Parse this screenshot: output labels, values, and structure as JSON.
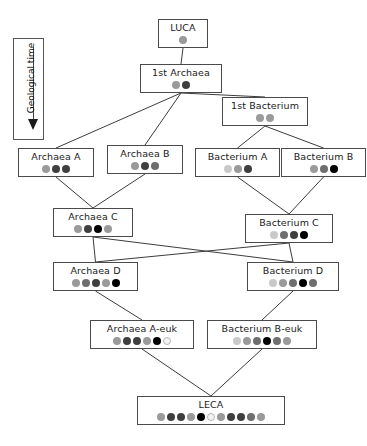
{
  "figure": {
    "type": "diagram",
    "subtype": "genome-evolution-tree",
    "axis": {
      "label": "Geological time",
      "direction_icon": "down-arrow-icon"
    }
  },
  "palette": {
    "light": "#c9c9c9",
    "gray": "#9a9a9a",
    "mid": "#6e6e6e",
    "dark": "#3f3f3f",
    "black": "#000000",
    "white": "#f4f4f4",
    "box_border": "#4a4a4a",
    "edge": "#3c3c3c",
    "background": "#ffffff"
  },
  "nodes": [
    {
      "id": "luca",
      "label": "LUCA",
      "genes": [
        "gray"
      ],
      "x": 158,
      "y": 19,
      "w": 50
    },
    {
      "id": "first_archaea",
      "label": "1st Archaea",
      "genes": [
        "gray",
        "dark"
      ],
      "x": 140,
      "y": 64,
      "w": 82
    },
    {
      "id": "first_bact",
      "label": "1st Bacterium",
      "genes": [
        "gray",
        "gray"
      ],
      "x": 222,
      "y": 97,
      "w": 86
    },
    {
      "id": "archaea_a",
      "label": "Archaea A",
      "genes": [
        "gray",
        "dark",
        "dark"
      ],
      "x": 18,
      "y": 148,
      "w": 76
    },
    {
      "id": "archaea_b",
      "label": "Archaea B",
      "genes": [
        "gray",
        "dark",
        "mid"
      ],
      "x": 107,
      "y": 145,
      "w": 76
    },
    {
      "id": "bacterium_a",
      "label": "Bacterium A",
      "genes": [
        "light",
        "gray",
        "dark"
      ],
      "x": 195,
      "y": 148,
      "w": 85
    },
    {
      "id": "bacterium_b",
      "label": "Bacterium B",
      "genes": [
        "gray",
        "mid",
        "black"
      ],
      "x": 281,
      "y": 148,
      "w": 85
    },
    {
      "id": "archaea_c",
      "label": "Archaea C",
      "genes": [
        "gray",
        "dark",
        "black",
        "gray"
      ],
      "x": 53,
      "y": 208,
      "w": 80
    },
    {
      "id": "bacterium_c",
      "label": "Bacterium C",
      "genes": [
        "light",
        "mid",
        "dark",
        "black"
      ],
      "x": 245,
      "y": 214,
      "w": 88
    },
    {
      "id": "archaea_d",
      "label": "Archaea D",
      "genes": [
        "gray",
        "mid",
        "dark",
        "gray",
        "black"
      ],
      "x": 53,
      "y": 262,
      "w": 85
    },
    {
      "id": "bacterium_d",
      "label": "Bacterium D",
      "genes": [
        "light",
        "gray",
        "mid",
        "black",
        "mid"
      ],
      "x": 247,
      "y": 262,
      "w": 92
    },
    {
      "id": "archaea_euk",
      "label": "Archaea A-euk",
      "genes": [
        "gray",
        "dark",
        "dark",
        "gray",
        "black",
        "white"
      ],
      "x": 90,
      "y": 320,
      "w": 104
    },
    {
      "id": "bacterium_euk",
      "label": "Bacterium B-euk",
      "genes": [
        "light",
        "gray",
        "mid",
        "black",
        "mid",
        "gray"
      ],
      "x": 207,
      "y": 320,
      "w": 110
    },
    {
      "id": "leca",
      "label": "LECA",
      "genes": [
        "gray",
        "dark",
        "dark",
        "gray",
        "black",
        "white",
        "gray",
        "dark",
        "dark",
        "mid",
        "gray"
      ],
      "x": 137,
      "y": 396,
      "w": 148
    }
  ],
  "edges": [
    {
      "from": "luca",
      "to": "first_archaea"
    },
    {
      "from": "first_archaea",
      "to": "first_bact"
    },
    {
      "from": "first_archaea",
      "to": "archaea_a"
    },
    {
      "from": "first_archaea",
      "to": "archaea_b"
    },
    {
      "from": "first_bact",
      "to": "bacterium_a"
    },
    {
      "from": "first_bact",
      "to": "bacterium_b"
    },
    {
      "from": "archaea_a",
      "to": "archaea_c"
    },
    {
      "from": "archaea_b",
      "to": "archaea_c"
    },
    {
      "from": "bacterium_a",
      "to": "bacterium_c"
    },
    {
      "from": "bacterium_b",
      "to": "bacterium_c"
    },
    {
      "from": "archaea_c",
      "to": "archaea_d"
    },
    {
      "from": "archaea_c",
      "to": "bacterium_d"
    },
    {
      "from": "bacterium_c",
      "to": "bacterium_d"
    },
    {
      "from": "bacterium_c",
      "to": "archaea_d"
    },
    {
      "from": "archaea_d",
      "to": "archaea_euk"
    },
    {
      "from": "bacterium_d",
      "to": "bacterium_euk"
    },
    {
      "from": "archaea_euk",
      "to": "leca"
    },
    {
      "from": "bacterium_euk",
      "to": "leca"
    }
  ]
}
